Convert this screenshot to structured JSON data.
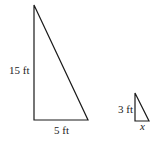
{
  "diagram": {
    "large_triangle": {
      "height_label": "15 ft",
      "base_label": "5 ft"
    },
    "small_triangle": {
      "height_label": "3 ft",
      "base_label": "x"
    },
    "line_color": "#1a1a1a"
  }
}
